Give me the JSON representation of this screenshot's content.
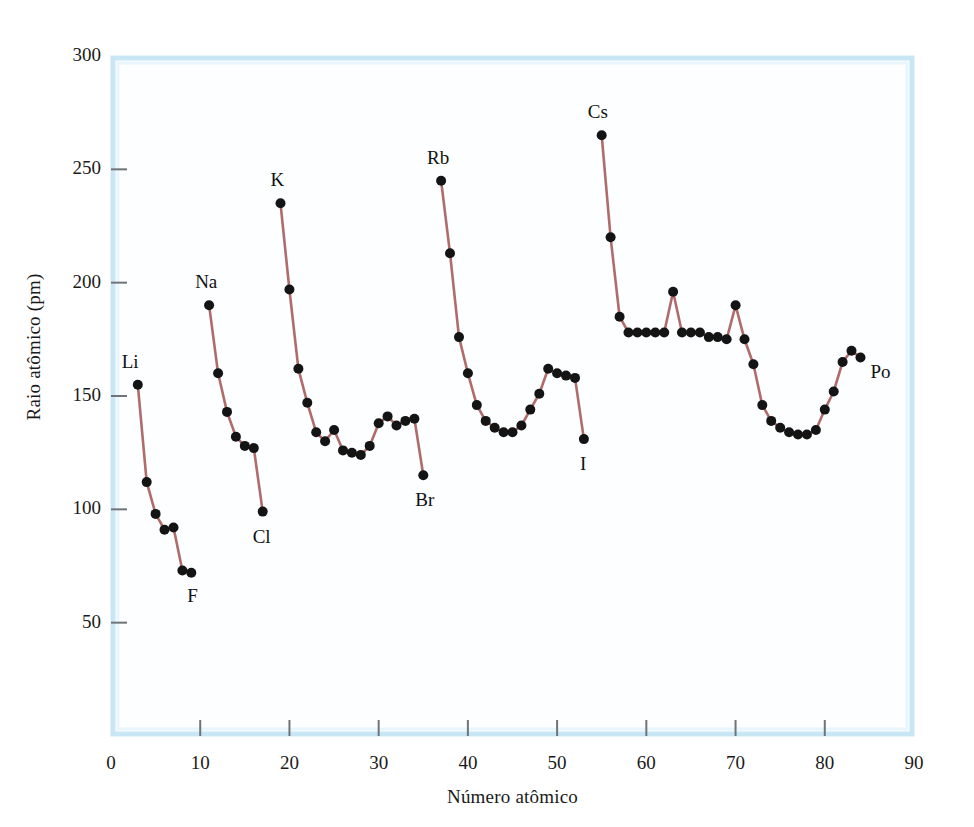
{
  "chart_data": {
    "type": "line",
    "title": "",
    "subtitle": "",
    "xlabel": "Número atômico",
    "ylabel": "Raio atômico (pm)",
    "xlim": [
      0,
      90
    ],
    "ylim": [
      0,
      300
    ],
    "xticks": [
      0,
      10,
      20,
      30,
      40,
      50,
      60,
      70,
      80,
      90
    ],
    "yticks": [
      50,
      100,
      150,
      200,
      250,
      300
    ],
    "grid": false,
    "legend": null,
    "line_color": "#b06b6b",
    "marker_color": "#141414",
    "plot_background": "#fcfeff",
    "plot_border_color": "#c9e6f5",
    "series": [
      {
        "name": "Período 2",
        "x": [
          3,
          4,
          5,
          6,
          7,
          8,
          9
        ],
        "values": [
          155,
          112,
          98,
          91,
          92,
          73,
          72
        ]
      },
      {
        "name": "Período 3",
        "x": [
          11,
          12,
          13,
          14,
          15,
          16,
          17
        ],
        "values": [
          190,
          160,
          143,
          132,
          128,
          127,
          99
        ]
      },
      {
        "name": "Período 4",
        "x": [
          19,
          20,
          21,
          22,
          23,
          24,
          25,
          26,
          27,
          28,
          29,
          30,
          31,
          32,
          33,
          34,
          35
        ],
        "values": [
          235,
          197,
          162,
          147,
          134,
          130,
          135,
          126,
          125,
          124,
          128,
          138,
          141,
          137,
          139,
          140,
          115
        ]
      },
      {
        "name": "Período 5",
        "x": [
          37,
          38,
          39,
          40,
          41,
          42,
          43,
          44,
          45,
          46,
          47,
          48,
          49,
          50,
          51,
          52,
          53
        ],
        "values": [
          245,
          213,
          176,
          160,
          146,
          139,
          136,
          134,
          134,
          137,
          144,
          151,
          162,
          160,
          159,
          158,
          131
        ]
      },
      {
        "name": "Período 6",
        "x": [
          55,
          56,
          57,
          58,
          59,
          60,
          61,
          62,
          63,
          64,
          65,
          66,
          67,
          68,
          69,
          70,
          71,
          72,
          73,
          74,
          75,
          76,
          77,
          78,
          79,
          80,
          81,
          82,
          83,
          84
        ],
        "values": [
          265,
          220,
          185,
          178,
          178,
          178,
          178,
          178,
          196,
          178,
          178,
          178,
          176,
          176,
          175,
          190,
          175,
          164,
          146,
          139,
          136,
          134,
          133,
          133,
          135,
          144,
          152,
          165,
          170,
          167
        ]
      }
    ],
    "annotations": [
      {
        "label": "Li",
        "x": 3,
        "y": 155
      },
      {
        "label": "F",
        "x": 9,
        "y": 72
      },
      {
        "label": "Na",
        "x": 11,
        "y": 190
      },
      {
        "label": "Cl",
        "x": 17,
        "y": 99
      },
      {
        "label": "K",
        "x": 19,
        "y": 235
      },
      {
        "label": "Br",
        "x": 35,
        "y": 115
      },
      {
        "label": "Rb",
        "x": 37,
        "y": 245
      },
      {
        "label": "I",
        "x": 53,
        "y": 131
      },
      {
        "label": "Cs",
        "x": 55,
        "y": 265
      },
      {
        "label": "Po",
        "x": 84,
        "y": 167
      }
    ]
  }
}
